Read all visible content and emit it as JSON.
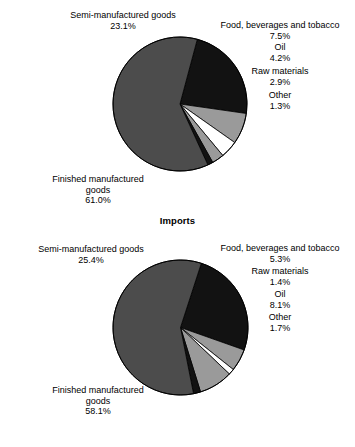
{
  "chart_data": [
    {
      "type": "pie",
      "title": "",
      "id": "exports",
      "categories": [
        "Semi-manufactured goods",
        "Food, beverages and tobacco",
        "Oil",
        "Raw materials",
        "Other",
        "Finished manufactured goods"
      ],
      "values": [
        23.1,
        7.5,
        4.2,
        2.9,
        1.3,
        61.0
      ],
      "value_labels": [
        "23.1%",
        "7.5%",
        "4.2%",
        "2.9%",
        "1.3%",
        "61.0%"
      ],
      "colors": [
        "#121212",
        "#9a9a9a",
        "#ffffff",
        "#9a9a9a",
        "#121212",
        "#4c4c4c"
      ],
      "legend": "none",
      "grid": false,
      "start_angle_deg": -75,
      "direction": "clockwise",
      "units": "percent"
    },
    {
      "type": "pie",
      "title": "Imports",
      "id": "imports",
      "categories": [
        "Semi-manufactured goods",
        "Food, beverages and tobacco",
        "Raw materials",
        "Oil",
        "Other",
        "Finished manufactured goods"
      ],
      "values": [
        25.4,
        5.3,
        1.4,
        8.1,
        1.7,
        58.1
      ],
      "value_labels": [
        "25.4%",
        "5.3%",
        "1.4%",
        "8.1%",
        "1.7%",
        "58.1%"
      ],
      "colors": [
        "#121212",
        "#9a9a9a",
        "#ffffff",
        "#9a9a9a",
        "#121212",
        "#4c4c4c"
      ],
      "legend": "none",
      "grid": false,
      "start_angle_deg": -72,
      "direction": "clockwise",
      "units": "percent"
    }
  ],
  "exports": {
    "labels": {
      "semi_name": "Semi-manufactured goods",
      "semi_value": "23.1%",
      "finished_name": "Finished manufactured",
      "finished_name2": "goods",
      "finished_value": "61.0%",
      "food_name": "Food, beverages and tobacco",
      "food_value": "7.5%",
      "oil_name": "Oil",
      "oil_value": "4.2%",
      "raw_name": "Raw materials",
      "raw_value": "2.9%",
      "other_name": "Other",
      "other_value": "1.3%"
    }
  },
  "imports": {
    "title": "Imports",
    "labels": {
      "semi_name": "Semi-manufactured goods",
      "semi_value": "25.4%",
      "finished_name": "Finished manufactured",
      "finished_name2": "goods",
      "finished_value": "58.1%",
      "food_name": "Food, beverages and tobacco",
      "food_value": "5.3%",
      "raw_name": "Raw materials",
      "raw_value": "1.4%",
      "oil_name": "Oil",
      "oil_value": "8.1%",
      "other_name": "Other",
      "other_value": "1.7%"
    }
  }
}
